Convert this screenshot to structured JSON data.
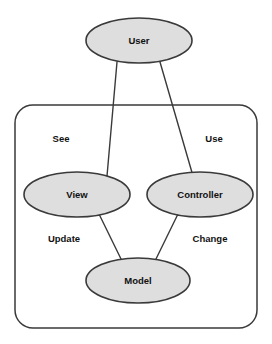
{
  "diagram": {
    "colors": {
      "node_fill": "#dedede",
      "stroke": "#3a3a3a",
      "text": "#111111",
      "background": "#ffffff"
    },
    "container": {
      "name": "mvc-boundary",
      "x": 15,
      "y": 105,
      "width": 242,
      "height": 223,
      "corner_radius": 18
    },
    "nodes": [
      {
        "id": "user",
        "label": "User",
        "cx": 139,
        "cy": 40.5,
        "rx": 53,
        "ry": 22.5,
        "inside_container": false
      },
      {
        "id": "view",
        "label": "View",
        "cx": 77,
        "cy": 194.5,
        "rx": 53,
        "ry": 22.5,
        "inside_container": true
      },
      {
        "id": "controller",
        "label": "Controller",
        "cx": 200,
        "cy": 194.5,
        "rx": 53,
        "ry": 22.5,
        "inside_container": true
      },
      {
        "id": "model",
        "label": "Model",
        "cx": 138,
        "cy": 280.5,
        "rx": 52,
        "ry": 22.5,
        "inside_container": true
      }
    ],
    "edges": [
      {
        "id": "user-view",
        "from": "user",
        "to": "view",
        "label": "See",
        "x1": 117,
        "y1": 62,
        "x2": 107,
        "y2": 176,
        "label_x": 61,
        "label_y": 139
      },
      {
        "id": "user-controller",
        "from": "user",
        "to": "controller",
        "label": "Use",
        "x1": 160,
        "y1": 62,
        "x2": 193,
        "y2": 176,
        "label_x": 214,
        "label_y": 139
      },
      {
        "id": "view-model",
        "from": "view",
        "to": "model",
        "label": "Update",
        "x1": 99,
        "y1": 214,
        "x2": 122,
        "y2": 261,
        "label_x": 64,
        "label_y": 239
      },
      {
        "id": "controller-model",
        "from": "controller",
        "to": "model",
        "label": "Change",
        "x1": 178,
        "y1": 214,
        "x2": 155,
        "y2": 261,
        "label_x": 210,
        "label_y": 239
      }
    ]
  }
}
